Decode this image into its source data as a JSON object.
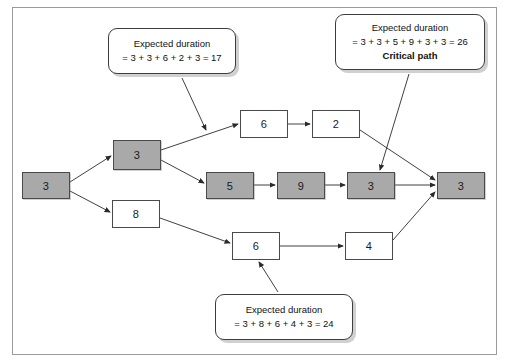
{
  "diagram": {
    "frame_color": "#9a9a9a",
    "shaded_fill": "#a9a9a9",
    "plain_fill": "#ffffff",
    "border_color": "#4a4a4a"
  },
  "nodes": [
    {
      "id": "start",
      "label": "3",
      "shaded": true,
      "x": 22,
      "y": 172,
      "w": 48,
      "h": 27
    },
    {
      "id": "a1",
      "label": "3",
      "shaded": true,
      "x": 113,
      "y": 140,
      "w": 48,
      "h": 30
    },
    {
      "id": "b1",
      "label": "8",
      "shaded": false,
      "x": 112,
      "y": 200,
      "w": 48,
      "h": 28
    },
    {
      "id": "t1",
      "label": "6",
      "shaded": false,
      "x": 240,
      "y": 110,
      "w": 48,
      "h": 28
    },
    {
      "id": "t2",
      "label": "2",
      "shaded": false,
      "x": 312,
      "y": 110,
      "w": 48,
      "h": 28
    },
    {
      "id": "m1",
      "label": "5",
      "shaded": true,
      "x": 206,
      "y": 172,
      "w": 48,
      "h": 27
    },
    {
      "id": "m2",
      "label": "9",
      "shaded": true,
      "x": 277,
      "y": 172,
      "w": 48,
      "h": 27
    },
    {
      "id": "m3",
      "label": "3",
      "shaded": true,
      "x": 347,
      "y": 172,
      "w": 48,
      "h": 27
    },
    {
      "id": "n1",
      "label": "6",
      "shaded": false,
      "x": 232,
      "y": 232,
      "w": 48,
      "h": 28
    },
    {
      "id": "n2",
      "label": "4",
      "shaded": false,
      "x": 345,
      "y": 232,
      "w": 48,
      "h": 28
    },
    {
      "id": "end",
      "label": "3",
      "shaded": true,
      "x": 437,
      "y": 172,
      "w": 48,
      "h": 27
    }
  ],
  "edges": [
    {
      "from": "start",
      "to": "a1",
      "x1": 70,
      "y1": 182,
      "x2": 111,
      "y2": 156
    },
    {
      "from": "start",
      "to": "b1",
      "x1": 70,
      "y1": 191,
      "x2": 110,
      "y2": 212
    },
    {
      "from": "a1",
      "to": "t1",
      "x1": 161,
      "y1": 150,
      "x2": 238,
      "y2": 124
    },
    {
      "from": "a1",
      "to": "m1",
      "x1": 161,
      "y1": 160,
      "x2": 204,
      "y2": 183
    },
    {
      "from": "t1",
      "to": "t2",
      "x1": 288,
      "y1": 124,
      "x2": 310,
      "y2": 124
    },
    {
      "from": "t2",
      "to": "end",
      "x1": 360,
      "y1": 130,
      "x2": 435,
      "y2": 180
    },
    {
      "from": "m1",
      "to": "m2",
      "x1": 254,
      "y1": 185,
      "x2": 275,
      "y2": 185
    },
    {
      "from": "m2",
      "to": "m3",
      "x1": 325,
      "y1": 185,
      "x2": 345,
      "y2": 185
    },
    {
      "from": "m3",
      "to": "end",
      "x1": 395,
      "y1": 185,
      "x2": 435,
      "y2": 185
    },
    {
      "from": "b1",
      "to": "n1",
      "x1": 160,
      "y1": 218,
      "x2": 230,
      "y2": 243
    },
    {
      "from": "n1",
      "to": "n2",
      "x1": 280,
      "y1": 246,
      "x2": 343,
      "y2": 246
    },
    {
      "from": "n2",
      "to": "end",
      "x1": 393,
      "y1": 240,
      "x2": 435,
      "y2": 192
    }
  ],
  "callouts": [
    {
      "id": "callout-top-left",
      "x": 108,
      "y": 28,
      "w": 128,
      "h": 46,
      "lines": [
        {
          "text": "Expected duration",
          "bold": false
        },
        {
          "text": "= 3 + 3 + 6 + 2 + 3 = 17",
          "bold": false
        }
      ],
      "leader": {
        "x1": 182,
        "y1": 78,
        "x2": 206,
        "y2": 130
      }
    },
    {
      "id": "callout-critical-path",
      "x": 335,
      "y": 14,
      "w": 150,
      "h": 56,
      "lines": [
        {
          "text": "Expected duration",
          "bold": false
        },
        {
          "text": "= 3 + 3 + 5 + 9 + 3 + 3 = 26",
          "bold": false
        },
        {
          "text": "Critical path",
          "bold": true
        }
      ],
      "leader": {
        "x1": 409,
        "y1": 74,
        "x2": 380,
        "y2": 170
      }
    },
    {
      "id": "callout-bottom",
      "x": 215,
      "y": 294,
      "w": 138,
      "h": 46,
      "lines": [
        {
          "text": "Expected duration",
          "bold": false
        },
        {
          "text": "= 3 + 8 + 6 + 4 + 3 = 24",
          "bold": false
        }
      ],
      "leader": {
        "x1": 278,
        "y1": 292,
        "x2": 259,
        "y2": 262
      }
    }
  ]
}
